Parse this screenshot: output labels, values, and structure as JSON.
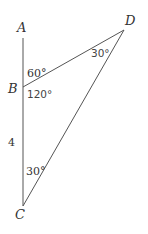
{
  "diagram": {
    "type": "triangle-geometry",
    "points": [
      {
        "id": "A",
        "label": "A",
        "x": 23,
        "y": 38
      },
      {
        "id": "B",
        "label": "B",
        "x": 23,
        "y": 87
      },
      {
        "id": "C",
        "label": "C",
        "x": 23,
        "y": 206
      },
      {
        "id": "D",
        "label": "D",
        "x": 124,
        "y": 30
      }
    ],
    "segments": [
      [
        "A",
        "C"
      ],
      [
        "B",
        "D"
      ],
      [
        "D",
        "C"
      ]
    ],
    "labels": {
      "A": "A",
      "B": "B",
      "C": "C",
      "D": "D",
      "side_BC": "4",
      "angle_ABD": "60°",
      "angle_DBC": "120°",
      "angle_BDC": "30°",
      "angle_BCD": "30°"
    },
    "colors": {
      "line": "#555555",
      "text": "#333333",
      "background": "#ffffff"
    }
  }
}
